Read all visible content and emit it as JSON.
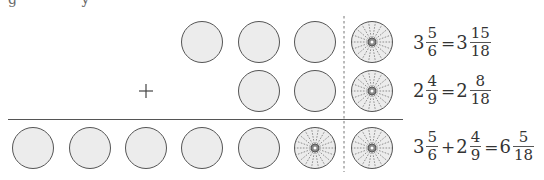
{
  "header_partial_text": "g y",
  "diagram": {
    "operator": "+",
    "rows": [
      {
        "label": "addend-1",
        "whole_circles": 3,
        "partitioned_circle": {
          "parts": 18,
          "shaded": 15
        }
      },
      {
        "label": "addend-2",
        "whole_circles": 2,
        "partitioned_circle": {
          "parts": 18,
          "shaded": 8
        }
      },
      {
        "label": "sum",
        "whole_circles": 5,
        "extra_partitioned_circle": {
          "parts": 18,
          "shaded": 18
        },
        "partitioned_circle": {
          "parts": 18,
          "shaded": 5
        }
      }
    ],
    "colors": {
      "circle_fill": "#ececec",
      "circle_stroke": "#555555",
      "line": "#555555"
    }
  },
  "equations": [
    {
      "lhs": {
        "whole": "3",
        "num": "5",
        "den": "6"
      },
      "eq": "=",
      "rhs": {
        "whole": "3",
        "num": "15",
        "den": "18"
      }
    },
    {
      "lhs": {
        "whole": "2",
        "num": "4",
        "den": "9"
      },
      "eq": "=",
      "rhs": {
        "whole": "2",
        "num": "8",
        "den": "18"
      }
    },
    {
      "a": {
        "whole": "3",
        "num": "5",
        "den": "6"
      },
      "plus": "+",
      "b": {
        "whole": "2",
        "num": "4",
        "den": "9"
      },
      "eq": "=",
      "result": {
        "whole": "6",
        "num": "5",
        "den": "18"
      }
    }
  ]
}
